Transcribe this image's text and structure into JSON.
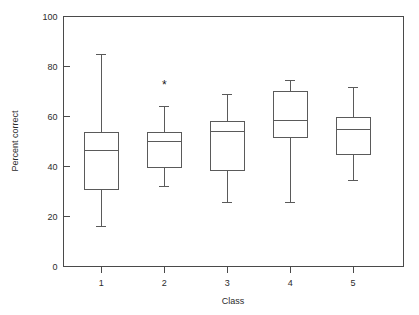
{
  "chart_data": {
    "type": "box",
    "title": "",
    "xlabel": "Class",
    "ylabel": "Percent correct",
    "categories": [
      "1",
      "2",
      "3",
      "4",
      "5"
    ],
    "ylim": [
      0,
      100
    ],
    "xlim": [
      0.4,
      5.8
    ],
    "yticks": [
      0,
      20,
      40,
      60,
      80,
      100
    ],
    "ytick_labels": [
      "0",
      "20",
      "40",
      "60",
      "80",
      "100"
    ],
    "xtick_labels": [
      "1",
      "2",
      "3",
      "4",
      "5"
    ],
    "grid": false,
    "legend": false,
    "boxes": [
      {
        "category": "1",
        "whisker_low": 16.0,
        "q1": 31.0,
        "median": 46.5,
        "q3": 53.5,
        "whisker_high": 85.0,
        "outliers": []
      },
      {
        "category": "2",
        "whisker_low": 32.0,
        "q1": 39.5,
        "median": 50.0,
        "q3": 53.5,
        "whisker_high": 64.0,
        "outliers": [
          72.5
        ]
      },
      {
        "category": "3",
        "whisker_low": 25.5,
        "q1": 38.5,
        "median": 54.0,
        "q3": 58.0,
        "whisker_high": 69.0,
        "outliers": []
      },
      {
        "category": "4",
        "whisker_low": 25.5,
        "q1": 51.5,
        "median": 58.5,
        "q3": 70.0,
        "whisker_high": 74.5,
        "outliers": []
      },
      {
        "category": "5",
        "whisker_low": 34.5,
        "q1": 45.0,
        "median": 55.0,
        "q3": 59.5,
        "whisker_high": 71.5,
        "outliers": []
      }
    ],
    "outlier_marker": "*",
    "colors": {
      "box_stroke": "#5a5a5a",
      "axis": "#4a4a4a",
      "text": "#2b2b2b",
      "background": "#ffffff"
    }
  },
  "axes": {
    "y_title": "Percent correct",
    "x_title": "Class"
  }
}
